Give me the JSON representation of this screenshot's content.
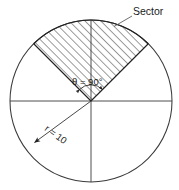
{
  "figure": {
    "type": "geometry-diagram",
    "background_color": "#ffffff",
    "stroke_color": "#333333",
    "text_color": "#1a1a1a"
  },
  "circle": {
    "center_x": 91,
    "center_y": 101,
    "radius_px": 81,
    "label": "circle-outline"
  },
  "centerlines": {
    "horizontal": {
      "x1": 10,
      "y1": 101,
      "x2": 172,
      "y2": 101
    },
    "vertical": {
      "x1": 91,
      "y1": 20,
      "x2": 91,
      "y2": 182
    }
  },
  "sector": {
    "start_angle_deg": 45,
    "end_angle_deg": 135,
    "hatched": true,
    "hatch_angle_deg": 45,
    "hatch_spacing_px": 4,
    "label": "Sector",
    "leader": {
      "x1": 114,
      "y1": 26,
      "x2": 132,
      "y2": 16
    }
  },
  "annotations": {
    "sector_label": "Sector",
    "angle_symbol": "θ",
    "angle_equals": " = ",
    "angle_value": "90°",
    "angle_full": "θ = 90°",
    "radius_symbol": "r",
    "radius_equals": " = ",
    "radius_value": "10",
    "radius_full": "r = 10"
  },
  "radius_dimension": {
    "from_x": 91,
    "from_y": 101,
    "to_x": 33,
    "to_y": 143,
    "direction_deg": 216,
    "arrowhead": "at-circle-edge"
  }
}
